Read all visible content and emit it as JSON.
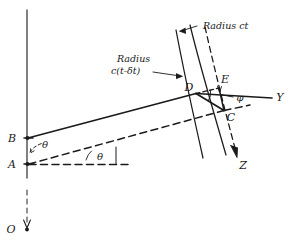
{
  "figure": {
    "title_note_1": "Radius ct",
    "title_note_2_line1": "Radius",
    "title_note_2_line2": "c(t-δt)",
    "points": {
      "O": "O",
      "A": "A",
      "B": "B",
      "C": "C",
      "D": "D",
      "E": "E"
    },
    "axes": {
      "Y": "Y",
      "Z": "Z"
    },
    "angles": {
      "theta_at_B": "θ",
      "theta_at_A": "θ",
      "phi_at_D": "φ"
    },
    "colors": {
      "ink": "#1a1a1a",
      "axis": "#4a4a4a",
      "background": "#ffffff"
    }
  }
}
